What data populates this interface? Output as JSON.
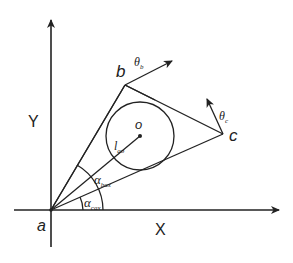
{
  "diagram": {
    "axes": {
      "x_label": "X",
      "y_label": "Y"
    },
    "points": {
      "a": "a",
      "b": "b",
      "c": "c",
      "o": "o"
    },
    "labels": {
      "theta_b": {
        "symbol": "θ",
        "sub": "b"
      },
      "theta_c": {
        "symbol": "θ",
        "sub": "c"
      },
      "l_ao": {
        "symbol": "l",
        "sub": "ao"
      },
      "alpha_bax": {
        "symbol": "α",
        "sub": "bax"
      },
      "alpha_cax": {
        "symbol": "α",
        "sub": "cax"
      }
    },
    "colors": {
      "stroke": "#222222",
      "background": "#ffffff"
    }
  }
}
